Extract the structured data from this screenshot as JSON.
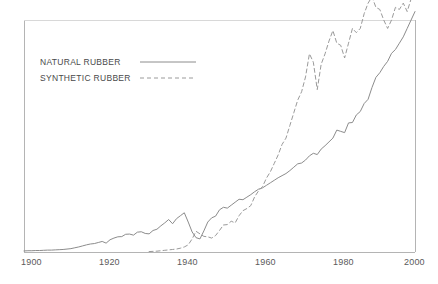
{
  "chart_data": {
    "type": "line",
    "title": "",
    "xlabel": "",
    "ylabel": "",
    "xlim": [
      1900,
      2000
    ],
    "ylim": [
      0,
      11
    ],
    "grid": false,
    "legend_position": "top-left",
    "xticks": [
      "1900",
      "1920",
      "1940",
      "1960",
      "1980",
      "2000"
    ],
    "xtick_values": [
      1900,
      1920,
      1940,
      1960,
      1980,
      2000
    ],
    "yticks": [],
    "series": [
      {
        "name": "NATURAL RUBBER",
        "style": "solid",
        "color": "#8c8c8c",
        "x": [
          1900,
          1901,
          1902,
          1903,
          1904,
          1905,
          1906,
          1907,
          1908,
          1909,
          1910,
          1911,
          1912,
          1913,
          1914,
          1915,
          1916,
          1917,
          1918,
          1919,
          1920,
          1921,
          1922,
          1923,
          1924,
          1925,
          1926,
          1927,
          1928,
          1929,
          1930,
          1931,
          1932,
          1933,
          1934,
          1935,
          1936,
          1937,
          1938,
          1939,
          1940,
          1941,
          1942,
          1943,
          1944,
          1945,
          1946,
          1947,
          1948,
          1949,
          1950,
          1951,
          1952,
          1953,
          1954,
          1955,
          1956,
          1957,
          1958,
          1959,
          1960,
          1961,
          1962,
          1963,
          1964,
          1965,
          1966,
          1967,
          1968,
          1969,
          1970,
          1971,
          1972,
          1973,
          1974,
          1975,
          1976,
          1977,
          1978,
          1979,
          1980,
          1981,
          1982,
          1983,
          1984,
          1985,
          1986,
          1987,
          1988,
          1989,
          1990,
          1991,
          1992,
          1993,
          1994,
          1995,
          1996,
          1997,
          1998,
          1999,
          2000
        ],
        "y": [
          0.05,
          0.06,
          0.06,
          0.07,
          0.07,
          0.08,
          0.09,
          0.09,
          0.1,
          0.11,
          0.12,
          0.14,
          0.16,
          0.2,
          0.24,
          0.29,
          0.34,
          0.38,
          0.4,
          0.45,
          0.5,
          0.42,
          0.58,
          0.66,
          0.72,
          0.73,
          0.84,
          0.85,
          0.8,
          0.94,
          0.96,
          0.88,
          0.86,
          1.02,
          1.08,
          1.24,
          1.38,
          1.54,
          1.34,
          1.58,
          1.72,
          1.86,
          1.42,
          0.95,
          0.68,
          0.62,
          1.0,
          1.42,
          1.62,
          1.7,
          2.0,
          2.12,
          2.08,
          2.22,
          2.36,
          2.5,
          2.48,
          2.6,
          2.72,
          2.86,
          2.98,
          3.04,
          3.16,
          3.28,
          3.4,
          3.52,
          3.62,
          3.72,
          3.86,
          4.02,
          4.18,
          4.22,
          4.36,
          4.56,
          4.68,
          4.62,
          4.88,
          5.04,
          5.22,
          5.4,
          5.78,
          5.72,
          5.66,
          6.12,
          6.14,
          6.5,
          6.66,
          7.04,
          7.24,
          7.8,
          8.28,
          8.5,
          8.8,
          9.04,
          9.42,
          9.6,
          9.9,
          10.2,
          10.6,
          11.0,
          11.4
        ]
      },
      {
        "name": "SYNTHETIC RUBBER",
        "style": "dashed",
        "color": "#9a9a9a",
        "x": [
          1932,
          1933,
          1934,
          1935,
          1936,
          1937,
          1938,
          1939,
          1940,
          1941,
          1942,
          1943,
          1944,
          1945,
          1946,
          1947,
          1948,
          1949,
          1950,
          1951,
          1952,
          1953,
          1954,
          1955,
          1956,
          1957,
          1958,
          1959,
          1960,
          1961,
          1962,
          1963,
          1964,
          1965,
          1966,
          1967,
          1968,
          1969,
          1970,
          1971,
          1972,
          1973,
          1974,
          1975,
          1976,
          1977,
          1978,
          1979,
          1980,
          1981,
          1982,
          1983,
          1984,
          1985,
          1986,
          1987,
          1988,
          1989,
          1990,
          1991,
          1992,
          1993,
          1994,
          1995,
          1996,
          1997,
          1998,
          1999,
          2000
        ],
        "y": [
          0.02,
          0.03,
          0.04,
          0.06,
          0.08,
          0.1,
          0.12,
          0.14,
          0.18,
          0.24,
          0.34,
          0.62,
          0.98,
          0.86,
          0.74,
          0.72,
          0.66,
          0.78,
          1.02,
          1.28,
          1.3,
          1.46,
          1.38,
          1.72,
          1.96,
          2.06,
          2.2,
          2.62,
          2.9,
          3.1,
          3.5,
          3.8,
          4.2,
          4.6,
          5.1,
          5.4,
          6.0,
          6.6,
          7.2,
          7.6,
          8.3,
          9.4,
          9.0,
          7.7,
          8.9,
          9.4,
          10.0,
          10.5,
          9.9,
          9.8,
          9.2,
          9.9,
          10.6,
          10.4,
          10.6,
          11.3,
          11.8,
          12.1,
          11.6,
          11.5,
          11.0,
          10.6,
          11.0,
          11.6,
          11.5,
          11.8,
          11.4,
          12.0,
          12.4
        ]
      }
    ]
  },
  "legend": {
    "items": [
      {
        "label": "NATURAL RUBBER",
        "style": "solid"
      },
      {
        "label": "SYNTHETIC RUBBER",
        "style": "dashed"
      }
    ]
  },
  "axis": {
    "frame_color": "#aaaaaa",
    "label_color": "#5a5a5a"
  }
}
